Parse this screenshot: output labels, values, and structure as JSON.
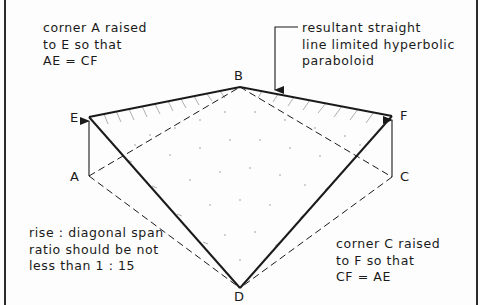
{
  "diagram": {
    "points": {
      "A": {
        "label": "A",
        "x": 89,
        "y": 176
      },
      "B": {
        "label": "B",
        "x": 240,
        "y": 87
      },
      "C": {
        "label": "C",
        "x": 392,
        "y": 177
      },
      "D": {
        "label": "D",
        "x": 240,
        "y": 288
      },
      "E": {
        "label": "E",
        "x": 89,
        "y": 117
      },
      "F": {
        "label": "F",
        "x": 392,
        "y": 116
      }
    },
    "edges": {
      "solid": [
        "E-B",
        "B-F",
        "E-D",
        "F-D"
      ],
      "dashed": [
        "A-B",
        "B-C",
        "A-D",
        "C-D"
      ],
      "arrows": [
        "A-E",
        "C-F"
      ]
    },
    "notes": {
      "top_left": [
        "corner A  raised",
        "to E  so that",
        "AE = CF"
      ],
      "top_right": [
        "resultant  straight",
        "line  limited hyperbolic",
        "paraboloid"
      ],
      "bottom_left": [
        "rise  :  diagonal span",
        "ratio  should be  not",
        "less  than  1 : 15"
      ],
      "bottom_right": [
        "corner  C  raised",
        "to  F   so  that",
        "CF =  AE"
      ]
    },
    "colors": {
      "line": "#1a1a1a",
      "background": "#fdfdfd",
      "frame": "#2a2a2a",
      "hatching": "#8a8a8a"
    }
  }
}
